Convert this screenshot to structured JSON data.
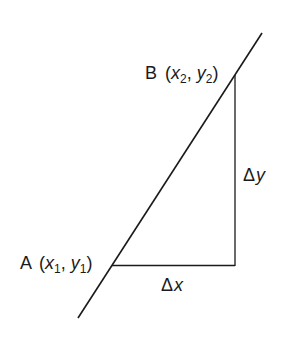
{
  "diagram": {
    "colors": {
      "stroke": "#1a1a1a",
      "background": "#ffffff"
    },
    "line": {
      "from": [
        78,
        318
      ],
      "to": [
        262,
        33
      ]
    },
    "point_a": {
      "name": "A",
      "x_var": "x",
      "x_sub": "1",
      "y_var": "y",
      "y_sub": "1",
      "pos": [
        112,
        265
      ]
    },
    "point_b": {
      "name": "B",
      "x_var": "x",
      "x_sub": "2",
      "y_var": "y",
      "y_sub": "2",
      "pos": [
        235,
        75
      ]
    },
    "delta_x": {
      "symbol": "Δ",
      "var": "x"
    },
    "delta_y": {
      "symbol": "Δ",
      "var": "y"
    },
    "punct": {
      "open": "(",
      "comma": ", ",
      "close": ")"
    }
  }
}
